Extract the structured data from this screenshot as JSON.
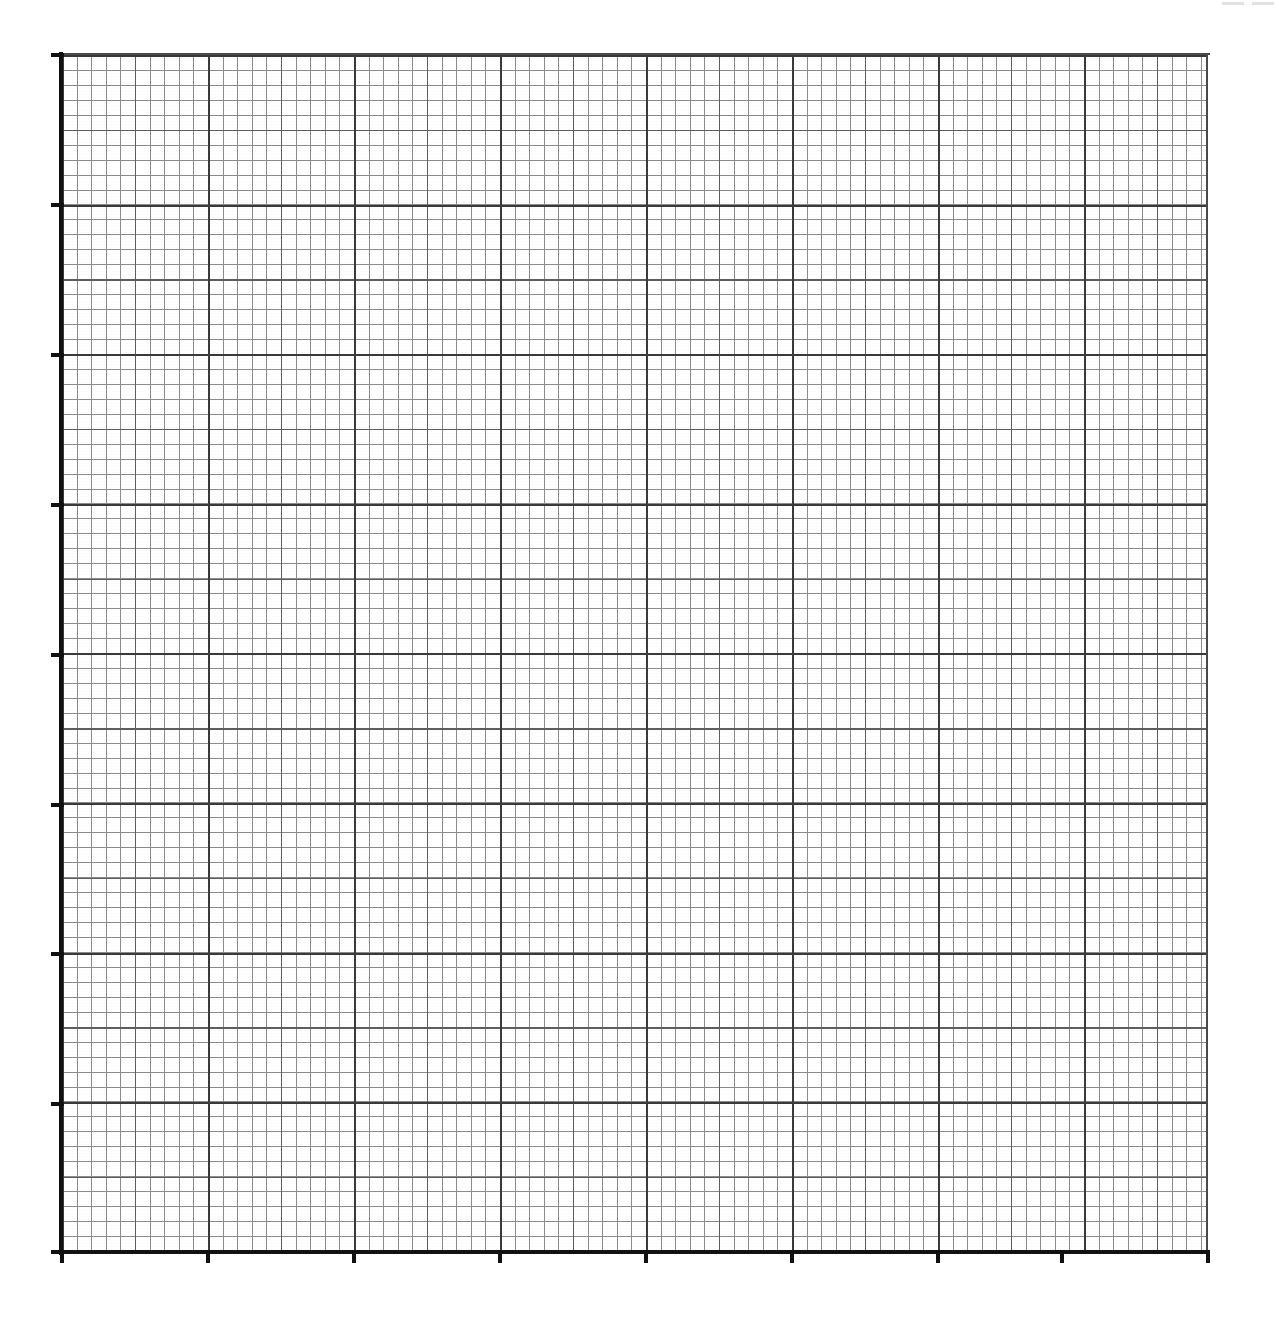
{
  "document": {
    "kind": "graph-paper",
    "title": "Blank Graph Paper Grid",
    "background_color": "#ffffff",
    "width": 1279,
    "height": 1323,
    "data_plotted": "none",
    "labels_present": "none"
  },
  "plot": {
    "left": 62,
    "top": 55,
    "right": 1208,
    "bottom": 1252,
    "width": 1146,
    "height": 1197,
    "minor_cell_px_x": 14.6,
    "minor_cell_px_y": 14.95,
    "medium_every_n_minor": 5,
    "major_every_n_minor": 10,
    "major_spacing_px_x": 146,
    "major_spacing_px_y": 149.6,
    "minor_line_color": "#8c8c8c",
    "medium_line_color": "#5e5e5e",
    "major_line_color": "#3a3a3a",
    "axis_color": "#111111"
  },
  "axes": {
    "y_axis_label": "",
    "x_axis_label": "",
    "y_tick_positions": [
      55,
      205,
      355,
      505,
      655,
      805,
      954,
      1104,
      1252
    ],
    "x_tick_positions": [
      62,
      208,
      354,
      500,
      646,
      792,
      938,
      1062,
      1208
    ],
    "y_tick_labels": [
      "",
      "",
      "",
      "",
      "",
      "",
      "",
      "",
      ""
    ],
    "x_tick_labels": [
      "",
      "",
      "",
      "",
      "",
      "",
      "",
      "",
      ""
    ]
  },
  "scan_artifacts": [
    {
      "left": 1222,
      "top": 2
    },
    {
      "left": 1252,
      "top": 2
    }
  ],
  "chart_data": {
    "type": "line",
    "title": "",
    "subtitle": "",
    "xlabel": "",
    "ylabel": "",
    "series": [],
    "categories": [],
    "x": [],
    "values": [],
    "annotations": [],
    "legend": [],
    "legend_position": "none",
    "grid": true,
    "grid_style": "engineering graph paper, 10 major divisions horizontally and 8 major divisions vertically, each major division subdivided into 10 minor cells with an intermediate line every 5 minor cells",
    "xlim": [
      0,
      10
    ],
    "ylim": [
      0,
      8
    ],
    "xticks": [
      0,
      1,
      2,
      3,
      4,
      5,
      6,
      7,
      8
    ],
    "yticks": [
      0,
      1,
      2,
      3,
      4,
      5,
      6,
      7,
      8
    ],
    "xtick_labels": [
      "",
      "",
      "",
      "",
      "",
      "",
      "",
      "",
      ""
    ],
    "ytick_labels": [
      "",
      "",
      "",
      "",
      "",
      "",
      "",
      "",
      ""
    ],
    "note": "Blank grid — no data series, no tick labels, no title rendered in the image."
  }
}
